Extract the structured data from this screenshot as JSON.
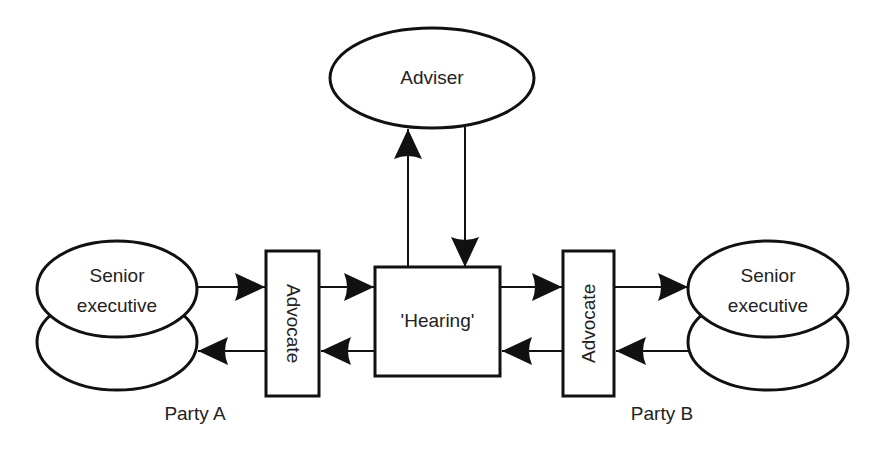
{
  "diagram": {
    "nodes": {
      "adviser": {
        "label": "Adviser"
      },
      "hearing": {
        "label": "'Hearing'"
      },
      "advocate_a": {
        "label": "Advocate"
      },
      "advocate_b": {
        "label": "Advocate"
      },
      "exec_a": {
        "line1": "Senior",
        "line2": "executive"
      },
      "exec_b": {
        "line1": "Senior",
        "line2": "executive"
      }
    },
    "party_labels": {
      "a": "Party A",
      "b": "Party B"
    },
    "edges": [
      {
        "from": "exec_a",
        "to": "advocate_a"
      },
      {
        "from": "advocate_a",
        "to": "exec_a"
      },
      {
        "from": "advocate_a",
        "to": "hearing"
      },
      {
        "from": "hearing",
        "to": "advocate_a"
      },
      {
        "from": "hearing",
        "to": "adviser"
      },
      {
        "from": "adviser",
        "to": "hearing"
      },
      {
        "from": "hearing",
        "to": "advocate_b"
      },
      {
        "from": "advocate_b",
        "to": "hearing"
      },
      {
        "from": "advocate_b",
        "to": "exec_b"
      },
      {
        "from": "exec_b",
        "to": "advocate_b"
      }
    ],
    "colors": {
      "stroke": "#111111",
      "background": "#ffffff"
    }
  }
}
